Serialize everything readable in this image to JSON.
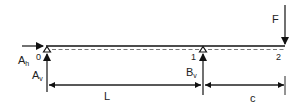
{
  "diagram": {
    "type": "beam-free-body-diagram",
    "nodes": [
      {
        "id": "0",
        "label": "0"
      },
      {
        "id": "1",
        "label": "1"
      },
      {
        "id": "2",
        "label": "2"
      }
    ],
    "forces": {
      "applied": "F",
      "reaction_horizontal_a": "A",
      "reaction_horizontal_a_sub": "h",
      "reaction_vertical_a": "A",
      "reaction_vertical_a_sub": "v",
      "reaction_vertical_b": "B",
      "reaction_vertical_b_sub": "v"
    },
    "dimensions": {
      "span": "L",
      "overhang": "c"
    },
    "colors": {
      "stroke": "#111111",
      "text": "#222222"
    }
  }
}
